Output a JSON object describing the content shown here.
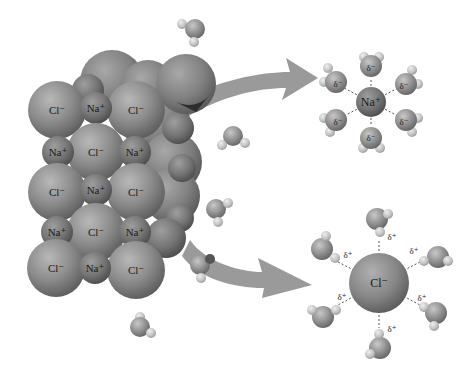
{
  "diagram": {
    "colors": {
      "background": "#ffffff",
      "chloride": "#8a8a8a",
      "sodium": "#7a7a7a",
      "oxygen": "#8c8c8c",
      "hydrogen": "#c4c4c4",
      "arrow": "#9a9a9a",
      "dashed_bond": "#555555"
    },
    "lattice": {
      "rows": [
        [
          "Cl⁻",
          "Na⁺",
          "Cl⁻"
        ],
        [
          "Na⁺",
          "Cl⁻",
          "Na⁺"
        ],
        [
          "Cl⁻",
          "Na⁺",
          "Cl⁻"
        ],
        [
          "Na⁺",
          "Cl⁻",
          "Na⁺"
        ],
        [
          "Cl⁻",
          "Na⁺",
          "Cl⁻"
        ]
      ]
    },
    "arrows": [
      {
        "name": "arrow-to-sodium",
        "from": "lattice",
        "to": "hydrated-sodium"
      },
      {
        "name": "arrow-to-chloride",
        "from": "lattice",
        "to": "hydrated-chloride"
      }
    ],
    "hydrated_sodium": {
      "ion_label": "Na⁺",
      "water_count": 6,
      "partial_charge_label": "δ⁻"
    },
    "hydrated_chloride": {
      "ion_label": "Cl⁻",
      "water_count": 6,
      "partial_charge_label": "δ⁺"
    }
  }
}
